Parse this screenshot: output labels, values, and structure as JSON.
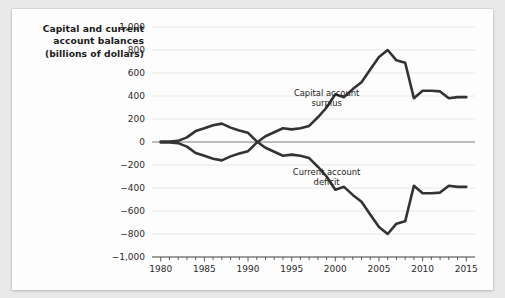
{
  "figure": {
    "title_lines": [
      "Capital and current",
      "account balances",
      "(billions of dollars)"
    ],
    "line_color": "#333333",
    "grid_color": "#e4e4e4",
    "zero_line_color": "#bdbdbd",
    "card_background": "#fdfdfd",
    "page_background": "#e9e9e9"
  },
  "chart_data": {
    "type": "line",
    "title": "Capital and current account balances (billions of dollars)",
    "xlabel": "",
    "ylabel": "billions of dollars",
    "xlim": [
      1979,
      2016
    ],
    "ylim": [
      -1000,
      1000
    ],
    "ytick_labels": [
      "1,000",
      "800",
      "600",
      "400",
      "200",
      "0",
      "−200",
      "−400",
      "−600",
      "−800",
      "−1,000"
    ],
    "ytick_values": [
      1000,
      800,
      600,
      400,
      200,
      0,
      -200,
      -400,
      -600,
      -800,
      -1000
    ],
    "xtick_labels": [
      "1980",
      "1985",
      "1990",
      "1995",
      "2000",
      "2005",
      "2010",
      "2015"
    ],
    "xtick_values": [
      1980,
      1985,
      1990,
      1995,
      2000,
      2005,
      2010,
      2015
    ],
    "xtick_minor_step": 1,
    "grid": true,
    "legend_position": "inline-annotations",
    "annotations": [
      {
        "text": "Capital account surplus",
        "x": 1999,
        "y": 400,
        "series": "Capital account surplus"
      },
      {
        "text": "Current account deficit",
        "x": 1999,
        "y": -290,
        "series": "Current account deficit"
      }
    ],
    "x": [
      1980,
      1981,
      1982,
      1983,
      1984,
      1985,
      1986,
      1987,
      1988,
      1989,
      1990,
      1991,
      1992,
      1993,
      1994,
      1995,
      1996,
      1997,
      1998,
      1999,
      2000,
      2001,
      2002,
      2003,
      2004,
      2005,
      2006,
      2007,
      2008,
      2009,
      2010,
      2011,
      2012,
      2013,
      2014,
      2015
    ],
    "series": [
      {
        "name": "Capital account surplus",
        "values": [
          5,
          5,
          10,
          40,
          95,
          120,
          145,
          160,
          125,
          100,
          80,
          5,
          -50,
          -85,
          -120,
          -110,
          -120,
          -140,
          -215,
          -300,
          -415,
          -390,
          -460,
          -520,
          -630,
          -740,
          -800,
          -710,
          -690,
          -380,
          -445,
          -445,
          -440,
          -380,
          -390,
          -390
        ]
      },
      {
        "name": "Current account deficit",
        "values": [
          -5,
          -5,
          -10,
          -40,
          -95,
          -120,
          -145,
          -160,
          -125,
          -100,
          -80,
          -5,
          50,
          85,
          120,
          110,
          120,
          140,
          215,
          300,
          415,
          390,
          460,
          520,
          630,
          740,
          800,
          710,
          690,
          380,
          445,
          445,
          440,
          380,
          390,
          390
        ]
      }
    ],
    "note": "Upper plotted curve is labeled 'Capital account surplus' (positive values); lower plotted curve is labeled 'Current account deficit' (negative values); the two are mirror images about zero."
  }
}
